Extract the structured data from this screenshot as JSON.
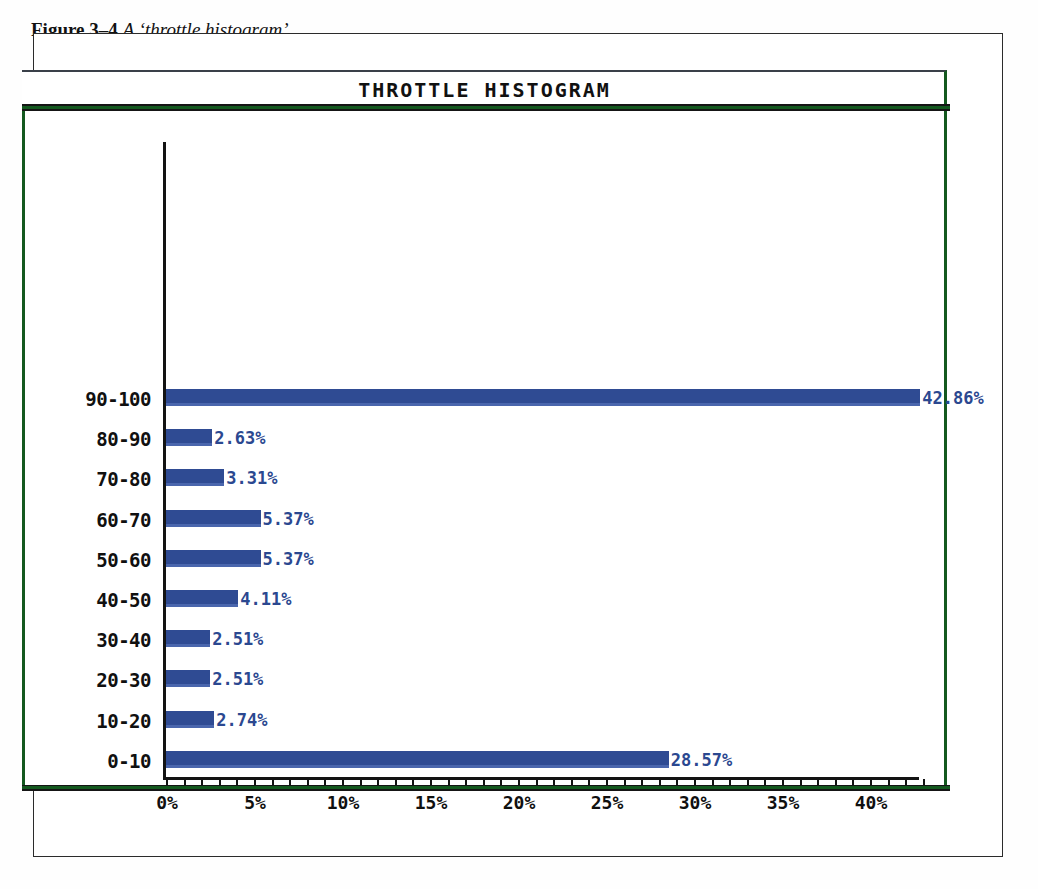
{
  "figure": {
    "number": "Figure 3–4",
    "caption": "A ‘throttle histogram’"
  },
  "chart_data": {
    "type": "bar",
    "orientation": "horizontal",
    "title": "THROTTLE HISTOGRAM",
    "xlabel": "",
    "ylabel": "",
    "xlim": [
      0,
      43
    ],
    "grid": false,
    "legend": null,
    "categories": [
      "90-100",
      "80-90",
      "70-80",
      "60-70",
      "50-60",
      "40-50",
      "30-40",
      "20-30",
      "10-20",
      "0-10"
    ],
    "values": [
      42.86,
      2.63,
      3.31,
      5.37,
      5.37,
      4.11,
      2.51,
      2.51,
      2.74,
      28.57
    ],
    "value_labels": [
      "42.86%",
      "2.63%",
      "3.31%",
      "5.37%",
      "5.37%",
      "4.11%",
      "2.51%",
      "2.51%",
      "2.74%",
      "28.57%"
    ],
    "x_tick_values": [
      0,
      5,
      10,
      15,
      20,
      25,
      30,
      35,
      40
    ],
    "x_tick_labels": [
      "0%",
      "5%",
      "10%",
      "15%",
      "20%",
      "25%",
      "30%",
      "35%",
      "40%"
    ],
    "x_minor_tick_step": 1,
    "colors": {
      "bar": "#2f4b93",
      "bar_highlight": "#4a66ad",
      "value_label": "#2b4890",
      "axis": "#131313",
      "frame_green": "#14591f",
      "frame_black": "#2b2b2b",
      "background": "#ffffff"
    }
  }
}
